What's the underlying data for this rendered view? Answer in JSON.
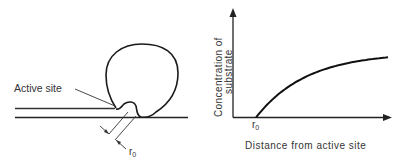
{
  "left_diagram": {
    "active_site_label": "Active site",
    "distance_label": "r",
    "distance_subscript": "0"
  },
  "right_chart": {
    "ylabel_line1": "Concentration of",
    "ylabel_line2": "substrate",
    "xlabel": "Distance from active site",
    "x_tick_label": "r",
    "x_tick_subscript": "0"
  },
  "chart_data": {
    "type": "line",
    "title": "",
    "xlabel": "Distance from active site",
    "ylabel": "Concentration of substrate",
    "x_ticks": [
      "r0"
    ],
    "series": [
      {
        "name": "substrate concentration",
        "shape": "concave saturating curve rising from zero at r0",
        "x": [
          0,
          0.1,
          0.25,
          0.5,
          0.75,
          1.0
        ],
        "y": [
          0,
          0.28,
          0.48,
          0.7,
          0.84,
          0.92
        ]
      }
    ],
    "grid": false,
    "legend": "none"
  },
  "colors": {
    "stroke": "#1a1a1a",
    "text": "#333333"
  }
}
